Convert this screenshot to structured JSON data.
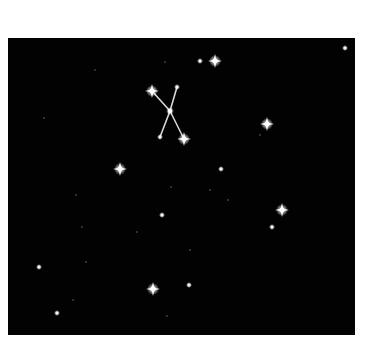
{
  "image": {
    "subject": "Star field with a highlighted X-shaped constellation",
    "background_color": "#020202",
    "frame_color": "#ffffff"
  },
  "constellation": {
    "stars": [
      {
        "x": 152,
        "y": 91,
        "size": "bright"
      },
      {
        "x": 177,
        "y": 87,
        "size": "small"
      },
      {
        "x": 170,
        "y": 111,
        "size": "medium"
      },
      {
        "x": 160,
        "y": 137,
        "size": "small"
      },
      {
        "x": 184,
        "y": 139,
        "size": "bright"
      }
    ],
    "lines": [
      [
        152,
        91,
        170,
        111
      ],
      [
        170,
        111,
        184,
        139
      ],
      [
        177,
        87,
        170,
        111
      ],
      [
        170,
        111,
        160,
        137
      ]
    ]
  },
  "stars": [
    {
      "x": 215,
      "y": 61,
      "size": "bright"
    },
    {
      "x": 200,
      "y": 61,
      "size": "small"
    },
    {
      "x": 345,
      "y": 48,
      "size": "small"
    },
    {
      "x": 267,
      "y": 124,
      "size": "bright"
    },
    {
      "x": 120,
      "y": 169,
      "size": "bright"
    },
    {
      "x": 221,
      "y": 169,
      "size": "small"
    },
    {
      "x": 282,
      "y": 210,
      "size": "bright"
    },
    {
      "x": 272,
      "y": 227,
      "size": "small"
    },
    {
      "x": 162,
      "y": 215,
      "size": "small"
    },
    {
      "x": 153,
      "y": 289,
      "size": "bright"
    },
    {
      "x": 189,
      "y": 285,
      "size": "small"
    },
    {
      "x": 39,
      "y": 267,
      "size": "small"
    },
    {
      "x": 57,
      "y": 313,
      "size": "small"
    },
    {
      "x": 44,
      "y": 118,
      "size": "tiny"
    },
    {
      "x": 165,
      "y": 62,
      "size": "tiny"
    },
    {
      "x": 95,
      "y": 70,
      "size": "tiny"
    },
    {
      "x": 76,
      "y": 195,
      "size": "tiny"
    },
    {
      "x": 82,
      "y": 227,
      "size": "tiny"
    },
    {
      "x": 137,
      "y": 232,
      "size": "tiny"
    },
    {
      "x": 190,
      "y": 250,
      "size": "tiny"
    },
    {
      "x": 228,
      "y": 200,
      "size": "tiny"
    },
    {
      "x": 210,
      "y": 190,
      "size": "tiny"
    },
    {
      "x": 171,
      "y": 187,
      "size": "tiny"
    },
    {
      "x": 86,
      "y": 262,
      "size": "tiny"
    },
    {
      "x": 73,
      "y": 300,
      "size": "tiny"
    },
    {
      "x": 167,
      "y": 316,
      "size": "tiny"
    },
    {
      "x": 260,
      "y": 135,
      "size": "tiny"
    }
  ]
}
